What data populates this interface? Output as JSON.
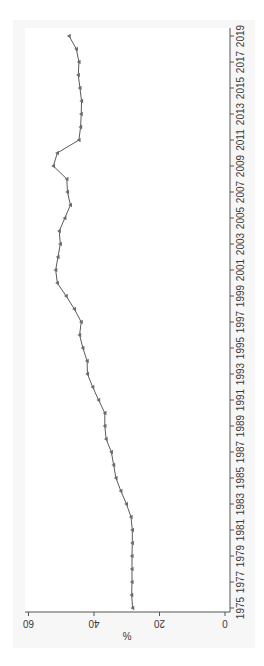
{
  "chart_data": {
    "type": "line",
    "title": "",
    "xlabel": "",
    "ylabel": "%",
    "ylim": [
      0,
      60
    ],
    "yticks": [
      0,
      20,
      40,
      60
    ],
    "xticks": [
      1975,
      1977,
      1979,
      1981,
      1983,
      1985,
      1987,
      1989,
      1991,
      1993,
      1995,
      1997,
      1999,
      2001,
      2003,
      2005,
      2007,
      2009,
      2011,
      2013,
      2015,
      2017,
      2019
    ],
    "orientation": "rotated 90 degrees clockwise",
    "grid": false,
    "legend": null,
    "marker": "triangle",
    "line_color": "#5a5a5a",
    "x": [
      1975,
      1976,
      1977,
      1978,
      1979,
      1980,
      1981,
      1982,
      1983,
      1984,
      1985,
      1986,
      1987,
      1988,
      1989,
      1990,
      1991,
      1992,
      1993,
      1994,
      1995,
      1996,
      1997,
      1998,
      1999,
      2000,
      2001,
      2002,
      2003,
      2004,
      2005,
      2006,
      2007,
      2008,
      2009,
      2010,
      2011,
      2012,
      2013,
      2014,
      2015,
      2016,
      2017,
      2018,
      2019
    ],
    "series": [
      {
        "name": "%",
        "values": [
          28.2,
          28.5,
          28.4,
          28.4,
          28.4,
          28.3,
          28.3,
          28.7,
          30.1,
          31.8,
          33.3,
          34.0,
          34.7,
          36.3,
          36.7,
          36.7,
          38.6,
          40.4,
          42.0,
          42.1,
          43.4,
          44.4,
          43.9,
          46.0,
          48.5,
          51.2,
          51.7,
          51.0,
          50.3,
          50.6,
          48.9,
          47.2,
          48.1,
          48.3,
          52.4,
          51.2,
          44.6,
          44.1,
          43.9,
          43.8,
          44.3,
          44.8,
          44.6,
          45.4,
          47.6
        ]
      }
    ]
  },
  "colors": {
    "panel_background": "#f7f7f7",
    "plot_background": "#ffffff",
    "axis": "#555555",
    "line": "#5a5a5a",
    "marker": "#6a6a6a"
  }
}
